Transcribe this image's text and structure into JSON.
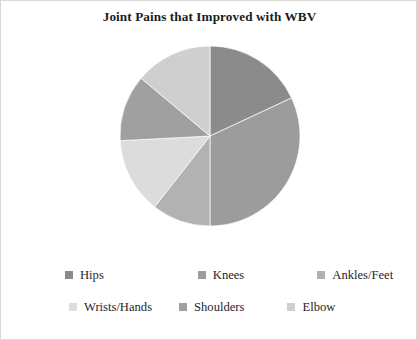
{
  "chart_data": {
    "type": "pie",
    "title": "Joint Pains that Improved with WBV",
    "xlabel": "",
    "ylabel": "",
    "legend_position": "bottom",
    "grid": false,
    "start_angle_deg": 0,
    "direction": "clockwise",
    "categories": [
      "Hips",
      "Knees",
      "Ankles/Feet",
      "Wrists/Hands",
      "Shoulders",
      "Elbow"
    ],
    "values": [
      18,
      32,
      10.5,
      13.5,
      12,
      14
    ],
    "value_unit": "percent",
    "colors": [
      "#8b8b8b",
      "#9c9c9c",
      "#b2b2b2",
      "#dcdcdc",
      "#a0a0a0",
      "#cfcfcf"
    ],
    "slices": [
      {
        "label": "Hips",
        "value": 18,
        "color": "#8b8b8b",
        "start_deg": 0,
        "end_deg": 65
      },
      {
        "label": "Knees",
        "value": 32,
        "color": "#9c9c9c",
        "start_deg": 65,
        "end_deg": 180
      },
      {
        "label": "Ankles/Feet",
        "value": 10.5,
        "color": "#b2b2b2",
        "start_deg": 180,
        "end_deg": 218
      },
      {
        "label": "Wrists/Hands",
        "value": 13.5,
        "color": "#dcdcdc",
        "start_deg": 218,
        "end_deg": 267
      },
      {
        "label": "Shoulders",
        "value": 12,
        "color": "#a0a0a0",
        "start_deg": 267,
        "end_deg": 310
      },
      {
        "label": "Elbow",
        "value": 14,
        "color": "#cfcfcf",
        "start_deg": 310,
        "end_deg": 360
      }
    ]
  },
  "legend": {
    "rows": [
      [
        {
          "label": "Hips",
          "color": "#8b8b8b"
        },
        {
          "label": "Knees",
          "color": "#9c9c9c"
        },
        {
          "label": "Ankles/Feet",
          "color": "#b2b2b2"
        }
      ],
      [
        {
          "label": "Wrists/Hands",
          "color": "#dcdcdc"
        },
        {
          "label": "Shoulders",
          "color": "#a0a0a0"
        },
        {
          "label": "Elbow",
          "color": "#cfcfcf"
        }
      ]
    ]
  },
  "frame": {
    "background": "#ffffff",
    "border_color": "#d9d9d9"
  }
}
